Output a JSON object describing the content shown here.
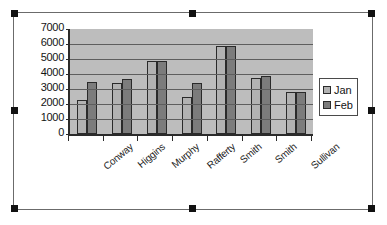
{
  "chart_object": {
    "selected": true,
    "handle_name": "selection-handle"
  },
  "legend": {
    "position": "right",
    "entries": [
      {
        "label": "Jan",
        "color": "#b2b2b2"
      },
      {
        "label": "Feb",
        "color": "#7c7c7c"
      }
    ]
  },
  "chart_data": {
    "type": "bar",
    "title": "",
    "subtitle": "",
    "xlabel": "",
    "ylabel": "",
    "ylim": [
      0,
      7000
    ],
    "ytick_step": 1000,
    "yticks": [
      7000,
      6000,
      5000,
      4000,
      3000,
      2000,
      1000,
      0
    ],
    "grid": true,
    "legend_position": "right",
    "categories": [
      "Conway",
      "Higgins",
      "Murphy",
      "Rafferty",
      "Smith",
      "Smith",
      "Sullivan"
    ],
    "series": [
      {
        "name": "Jan",
        "color": "#b2b2b2",
        "values": [
          2300,
          3400,
          4900,
          2450,
          5850,
          3750,
          2800
        ]
      },
      {
        "name": "Feb",
        "color": "#7c7c7c",
        "values": [
          3450,
          3700,
          4900,
          3400,
          5850,
          3850,
          2800
        ]
      }
    ]
  }
}
